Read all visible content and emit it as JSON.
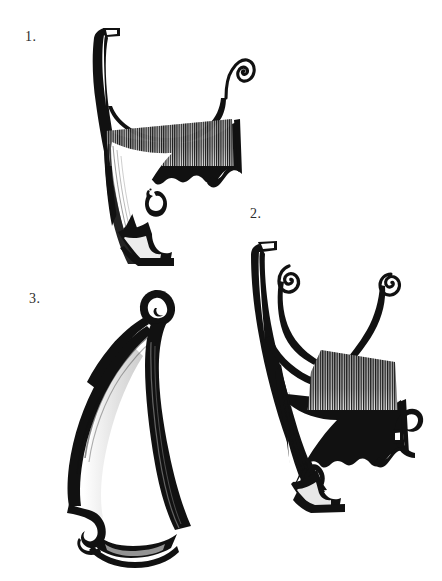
{
  "page": {
    "kind": "illustration-plate",
    "background_color": "#ffffff",
    "ink_color": "#111111",
    "width": 442,
    "height": 581
  },
  "figures": [
    {
      "id": "figure-1",
      "label": "1.",
      "label_x": 25,
      "label_y": 30,
      "art_x": 62,
      "art_y": 26,
      "art_w": 185,
      "art_h": 250,
      "notes": "Upper-left fragment: long curved left rib, single volute scroll at upper right, solid hatched lower body with notched waist."
    },
    {
      "id": "figure-2",
      "label": "2.",
      "label_x": 250,
      "label_y": 207,
      "art_x": 243,
      "art_y": 232,
      "art_w": 190,
      "art_h": 280,
      "notes": "Lower-right fragment: two volute scrolls at top forming a forked yoke, curved outer rib, solid hatched lower body with scrolled tail at right."
    },
    {
      "id": "figure-3",
      "label": "3.",
      "label_x": 29,
      "label_y": 292,
      "art_x": 55,
      "art_y": 282,
      "art_w": 150,
      "art_h": 272,
      "notes": "Lower-left fragment: leaf/teardrop silhouette with a small closed loop at the apex and a hooked notch with foot at the base."
    }
  ],
  "ink": {
    "fill": "#111111",
    "stroke": "#111111",
    "hatch": "#1a1a1a"
  }
}
